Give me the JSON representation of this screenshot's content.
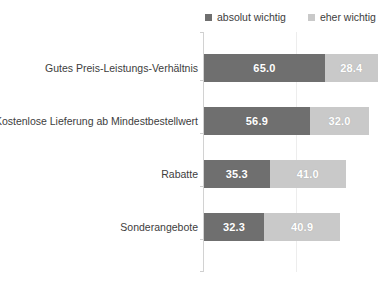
{
  "chart_data": {
    "type": "bar",
    "orientation": "horizontal",
    "stacked": true,
    "title": "",
    "subtitle": "",
    "xlabel": "",
    "ylabel": "",
    "xlim": [
      0,
      100
    ],
    "grid": true,
    "gridlines_x": [
      50
    ],
    "legend_position": "top-right",
    "categories": [
      "Gutes Preis-Leistungs-Verhältnis",
      "Kostenlose Lieferung ab Mindestbestellwert",
      "Rabatte",
      "Sonderangebote"
    ],
    "series": [
      {
        "name": "absolut wichtig",
        "color": "#6f6f6f",
        "values": [
          65.0,
          56.9,
          35.3,
          32.3
        ],
        "labels": [
          "65.0",
          "56.9",
          "35.3",
          "32.3"
        ]
      },
      {
        "name": "eher wichtig",
        "color": "#c9c9c9",
        "values": [
          28.4,
          32.0,
          41.0,
          40.9
        ],
        "labels": [
          "28.4",
          "32.0",
          "41.0",
          "40.9"
        ]
      }
    ]
  },
  "legend": {
    "entries": [
      {
        "label": "absolut wichtig",
        "color": "#6f6f6f"
      },
      {
        "label": "eher wichtig",
        "color": "#c9c9c9"
      }
    ]
  },
  "axis": {
    "line_color": "#d2d2d2",
    "grid_color": "#ededed"
  }
}
